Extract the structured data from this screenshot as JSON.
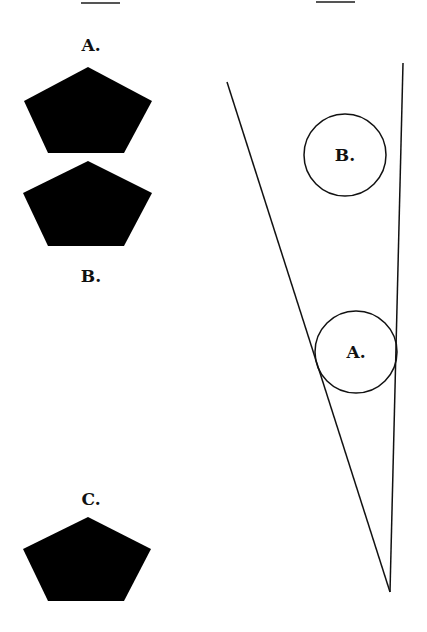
{
  "colors": {
    "shape_fill": "#000000",
    "stroke": "#111111",
    "background": "#ffffff",
    "rule": "#555555"
  },
  "left_panel": {
    "header_rule": {
      "x1": 81,
      "x2": 120,
      "y": 3
    },
    "items": [
      {
        "label": "A.",
        "label_pos": [
          91,
          51
        ],
        "pentagon": "88,67 152,101 124,153 48,153 24,101"
      },
      {
        "label": "B.",
        "label_pos": [
          91,
          282
        ],
        "pentagon": "88,161 152,193 124,246 48,246 23,193"
      },
      {
        "label": "C.",
        "label_pos": [
          91,
          505
        ],
        "pentagon": "88,517 151,549 124,601 48,601 23,549"
      }
    ]
  },
  "right_panel": {
    "header_rule": {
      "x1": 316,
      "x2": 355,
      "y": 2
    },
    "wedge": {
      "left_top": [
        227,
        82
      ],
      "right_top": [
        403,
        63
      ],
      "apex": [
        390,
        592
      ]
    },
    "circles": [
      {
        "label": "B.",
        "cx": 345,
        "cy": 155,
        "r": 41
      },
      {
        "label": "A.",
        "cx": 356,
        "cy": 352,
        "r": 41
      }
    ]
  }
}
